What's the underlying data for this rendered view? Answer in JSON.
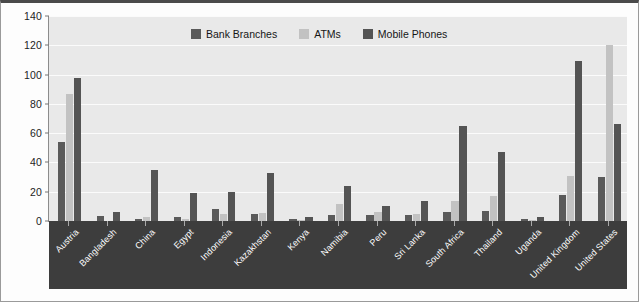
{
  "chart_data": {
    "type": "bar",
    "title": "",
    "xlabel": "",
    "ylabel": "",
    "ylim": [
      0,
      140
    ],
    "yticks": [
      0,
      20,
      40,
      60,
      80,
      100,
      120,
      140
    ],
    "grid": true,
    "legend_position": "top-center",
    "categories": [
      "Austria",
      "Bangladesh",
      "China",
      "Egypt",
      "Indonesia",
      "Kazakhstan",
      "Kenya",
      "Namibia",
      "Peru",
      "Sri Lanka",
      "South Africa",
      "Thailand",
      "Uganda",
      "United Kingdom",
      "United States"
    ],
    "series": [
      {
        "name": "Bank Branches",
        "color": "#5a5a5a",
        "values": [
          54,
          3.5,
          1.5,
          3,
          8,
          4.5,
          1.5,
          4,
          4,
          4,
          6,
          6.5,
          1.5,
          18,
          30
        ]
      },
      {
        "name": "ATMs",
        "color": "#c2c2c2",
        "values": [
          87,
          0,
          3,
          1.5,
          4.5,
          5.5,
          1,
          11.5,
          6,
          5,
          13.5,
          17,
          0.5,
          31,
          120
        ]
      },
      {
        "name": "Mobile Phones",
        "color": "#545454",
        "values": [
          98,
          6,
          35,
          19,
          20,
          33,
          2.5,
          24,
          10.5,
          14,
          65,
          47,
          3,
          109,
          66
        ]
      }
    ]
  }
}
